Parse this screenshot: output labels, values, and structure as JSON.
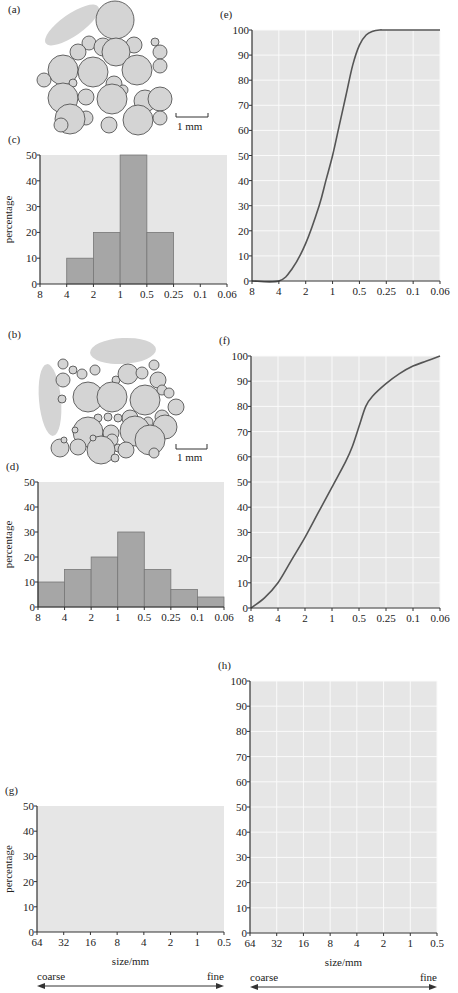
{
  "panels": {
    "a": {
      "label": "(a)",
      "scale_label": "1 mm"
    },
    "b": {
      "label": "(b)",
      "scale_label": "1 mm"
    }
  },
  "chart_data": [
    {
      "id": "c",
      "panel_label": "(c)",
      "type": "bar",
      "title": "",
      "xlabel": "",
      "ylabel": "percentage",
      "x_ticks": [
        "8",
        "4",
        "2",
        "1",
        "0.5",
        "0.25",
        "0.1",
        "0.06"
      ],
      "categories": [
        "8-4",
        "4-2",
        "2-1",
        "1-0.5",
        "0.5-0.25",
        "0.25-0.1",
        "0.1-0.06"
      ],
      "values": [
        0,
        10,
        20,
        50,
        20,
        0,
        0
      ],
      "y_ticks": [
        0,
        10,
        20,
        30,
        40,
        50
      ],
      "ylim": [
        0,
        50
      ],
      "grid": false
    },
    {
      "id": "d",
      "panel_label": "(d)",
      "type": "bar",
      "title": "",
      "xlabel": "",
      "ylabel": "percentage",
      "x_ticks": [
        "8",
        "4",
        "2",
        "1",
        "0.5",
        "0.25",
        "0.1",
        "0.06"
      ],
      "categories": [
        "8-4",
        "4-2",
        "2-1",
        "1-0.5",
        "0.5-0.25",
        "0.25-0.1",
        "0.1-0.06"
      ],
      "values": [
        10,
        15,
        20,
        30,
        15,
        7,
        4
      ],
      "y_ticks": [
        0,
        10,
        20,
        30,
        40,
        50
      ],
      "ylim": [
        0,
        50
      ],
      "grid": false
    },
    {
      "id": "e",
      "panel_label": "(e)",
      "type": "line",
      "title": "",
      "xlabel": "",
      "ylabel": "",
      "x_ticks": [
        "8",
        "4",
        "2",
        "1",
        "0.5",
        "0.25",
        "0.1",
        "0.06"
      ],
      "series": [
        {
          "name": "cumulative percentage",
          "x_index": [
            0,
            1,
            1.5,
            2,
            2.5,
            2.75,
            3,
            3.25,
            3.5,
            3.75,
            4,
            4.25,
            4.5,
            4.75,
            5,
            6,
            7
          ],
          "values": [
            0,
            0,
            5,
            15,
            30,
            40,
            50,
            62,
            74,
            86,
            94,
            98,
            99.5,
            100,
            100,
            100,
            100
          ]
        }
      ],
      "y_ticks": [
        0,
        10,
        20,
        30,
        40,
        50,
        60,
        70,
        80,
        90,
        100
      ],
      "ylim": [
        0,
        100
      ],
      "grid": true
    },
    {
      "id": "f",
      "panel_label": "(f)",
      "type": "line",
      "title": "",
      "xlabel": "",
      "ylabel": "",
      "x_ticks": [
        "8",
        "4",
        "2",
        "1",
        "0.5",
        "0.25",
        "0.1",
        "0.06"
      ],
      "series": [
        {
          "name": "cumulative percentage",
          "x_index": [
            0,
            0.5,
            1,
            1.5,
            2,
            2.5,
            3,
            3.5,
            3.75,
            4,
            4.25,
            4.5,
            5,
            5.5,
            6,
            6.5,
            7
          ],
          "values": [
            0,
            4,
            10,
            19,
            28,
            38,
            48,
            58,
            64,
            72,
            80,
            84,
            89,
            93,
            96,
            98,
            100
          ]
        }
      ],
      "y_ticks": [
        0,
        10,
        20,
        30,
        40,
        50,
        60,
        70,
        80,
        90,
        100
      ],
      "ylim": [
        0,
        100
      ],
      "grid": true
    },
    {
      "id": "g",
      "panel_label": "(g)",
      "type": "bar",
      "title": "",
      "xlabel": "size/mm",
      "ylabel": "percentage",
      "x_ticks": [
        "64",
        "32",
        "16",
        "8",
        "4",
        "2",
        "1",
        "0.5"
      ],
      "values": [],
      "y_ticks": [
        0,
        10,
        20,
        30,
        40,
        50
      ],
      "ylim": [
        0,
        50
      ],
      "grid": false,
      "annotation": {
        "left": "coarse",
        "right": "fine"
      }
    },
    {
      "id": "h",
      "panel_label": "(h)",
      "type": "line",
      "title": "",
      "xlabel": "size/mm",
      "ylabel": "",
      "x_ticks": [
        "64",
        "32",
        "16",
        "8",
        "4",
        "2",
        "1",
        "0.5"
      ],
      "series": [],
      "y_ticks": [
        0,
        10,
        20,
        30,
        40,
        50,
        60,
        70,
        80,
        90,
        100
      ],
      "ylim": [
        0,
        100
      ],
      "grid": true,
      "annotation": {
        "left": "coarse",
        "right": "fine"
      }
    }
  ],
  "colors": {
    "plot_bg": "#e6e6e6",
    "bar_fill": "#a6a6a6",
    "grain_fill": "#d4d4d4",
    "line": "#555555",
    "axis": "#333333"
  }
}
